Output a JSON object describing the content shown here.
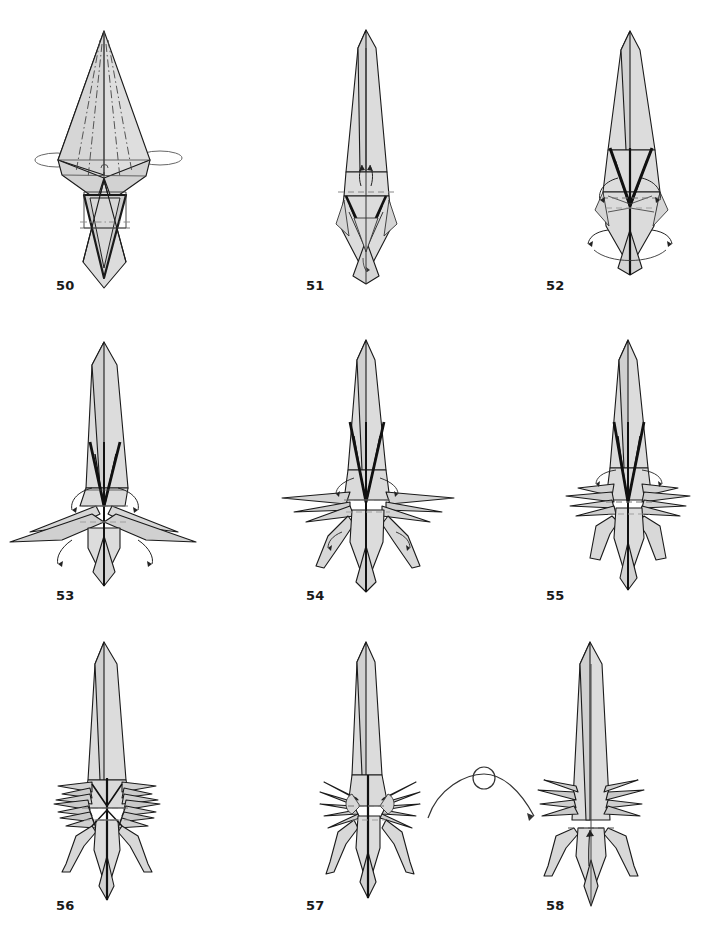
{
  "document": {
    "kind": "origami-folding-diagram",
    "page_background": "#ffffff",
    "ink_color": "#1a1a1a",
    "paper_fill_light": "#e2e2e2",
    "paper_fill_mid": "#cfcfcf",
    "paper_fill_dark": "#9a9a9a",
    "crease_color": "#6f6f6f"
  },
  "figures": [
    {
      "id": "fig-50",
      "label": "50",
      "row": 1,
      "column": 1,
      "description": "Tall kite-shaped base with long spike, dash-dot creases on the upper sail, small rotation loops at both sides of the waist",
      "symbols": [
        "mountain-valley-dash-dot-creases",
        "rotate-loop-left",
        "rotate-loop-right"
      ]
    },
    {
      "id": "fig-51",
      "label": "51",
      "row": 1,
      "column": 2,
      "description": "Narrow rocket-like shape, twin small arrows rising at the waist, dashed horizontal crease across the body",
      "symbols": [
        "valley-fold-dashed-line",
        "arrow-up-left",
        "arrow-up-right"
      ]
    },
    {
      "id": "fig-52",
      "label": "52",
      "row": 1,
      "column": 3,
      "description": "Same narrow body with dark inner diamond, four curved arrows swinging outward at waist and lower body",
      "symbols": [
        "curved-arrow-upper-left",
        "curved-arrow-upper-right",
        "curved-arrow-lower-left",
        "curved-arrow-lower-right",
        "valley-fold-dashed-line"
      ]
    },
    {
      "id": "fig-53",
      "label": "53",
      "row": 2,
      "column": 1,
      "description": "Body with two long swept-back wings spread wide, four curved arrows indicating further unfolding of the wings",
      "symbols": [
        "curved-arrow-upper-left",
        "curved-arrow-upper-right",
        "curved-arrow-lower-left",
        "curved-arrow-lower-right"
      ]
    },
    {
      "id": "fig-54",
      "label": "54",
      "row": 2,
      "column": 2,
      "description": "Multiple thin spikes fanned out at each side plus two lower legs forming, small arrows at spike tips",
      "symbols": [
        "curved-arrow-left",
        "curved-arrow-right",
        "small-arrow-leg-left",
        "small-arrow-leg-right"
      ]
    },
    {
      "id": "fig-55",
      "label": "55",
      "row": 2,
      "column": 3,
      "description": "Three pairs of long narrow spikes at the waist, two legs angled downward, two small curved arrows at the top of the waist",
      "symbols": [
        "curved-arrow-left",
        "curved-arrow-right",
        "valley-fold-dashed-line"
      ]
    },
    {
      "id": "fig-56",
      "label": "56",
      "row": 3,
      "column": 1,
      "description": "Dense cluster of many fine spikes at the waist, legs with pointed feet, body tapering to a sharp tail",
      "symbols": [
        "valley-fold-dashed-line"
      ]
    },
    {
      "id": "fig-57",
      "label": "57",
      "row": 3,
      "column": 2,
      "description": "Spikes refined into clean thin needles on both sides, rounded knuckle joints, two articulated legs",
      "symbols": [
        "valley-fold-dashed-line"
      ]
    },
    {
      "id": "fig-58",
      "label": "58",
      "row": 3,
      "column": 3,
      "description": "Model turned over, showing plain back with spikes on both sides, a dashed fold line and one upward arrow on the lower body",
      "symbols": [
        "valley-fold-dashed-line",
        "arrow-up"
      ]
    }
  ],
  "symbols": {
    "turn_over": {
      "name": "turn-over-symbol",
      "between": [
        "57",
        "58"
      ],
      "description": "Looped arc arrow with a small circle at the apex meaning turn the model over"
    }
  }
}
